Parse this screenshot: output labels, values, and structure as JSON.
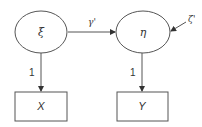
{
  "diagram": {
    "type": "path-diagram",
    "latent_nodes": [
      {
        "id": "xi",
        "label": "ξ"
      },
      {
        "id": "eta",
        "label": "η"
      }
    ],
    "observed_nodes": [
      {
        "id": "X",
        "label": "X"
      },
      {
        "id": "Y",
        "label": "Y"
      }
    ],
    "edges": [
      {
        "from": "xi",
        "to": "eta",
        "label": "γ'"
      },
      {
        "from": "zeta",
        "to": "eta",
        "label": "ζ'"
      },
      {
        "from": "xi",
        "to": "X",
        "label": "1"
      },
      {
        "from": "eta",
        "to": "Y",
        "label": "1"
      }
    ],
    "colors": {
      "stroke": "#555555",
      "text": "#333333",
      "background": "#ffffff"
    }
  }
}
